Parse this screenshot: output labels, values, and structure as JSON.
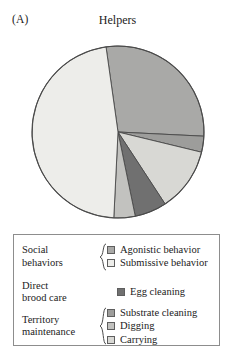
{
  "figure": {
    "panel_label": "(A)",
    "title": "Helpers"
  },
  "chart_data": {
    "type": "pie",
    "title": "Helpers",
    "xlabel": "",
    "ylabel": "",
    "legend_position": "bottom",
    "grid": false,
    "start_angle_deg": -98,
    "direction": "clockwise",
    "categories": [
      "Agonistic behavior",
      "Substrate cleaning",
      "Carrying",
      "Egg cleaning",
      "Digging",
      "Submissive behavior"
    ],
    "values": [
      28,
      3,
      12,
      6,
      4,
      47
    ],
    "unit": "percent of behavior",
    "colors": [
      "#a9a9a7",
      "#9d9d9b",
      "#d8d8d4",
      "#707070",
      "#c2c2bf",
      "#ededea"
    ],
    "slices": [
      {
        "label": "Agonistic behavior",
        "value": 28,
        "color": "#a9a9a7"
      },
      {
        "label": "Substrate cleaning",
        "value": 3,
        "color": "#9d9d9b"
      },
      {
        "label": "Carrying",
        "value": 12,
        "color": "#d8d8d4"
      },
      {
        "label": "Egg cleaning",
        "value": 6,
        "color": "#707070"
      },
      {
        "label": "Digging",
        "value": 4,
        "color": "#c2c2bf"
      },
      {
        "label": "Submissive behavior",
        "value": 47,
        "color": "#ededea"
      }
    ],
    "stroke_color": "#4a4a4a"
  },
  "legend": {
    "groups": [
      {
        "id": "social",
        "label_line1": "Social",
        "label_line2": "behaviors",
        "has_brace": true,
        "entries": [
          {
            "label": "Agonistic behavior",
            "color": "#a9a9a7"
          },
          {
            "label": "Submissive behavior",
            "color": "#ededea"
          }
        ]
      },
      {
        "id": "brood",
        "label_line1": "Direct",
        "label_line2": "brood care",
        "has_brace": false,
        "entries": [
          {
            "label": "Egg cleaning",
            "color": "#707070"
          }
        ]
      },
      {
        "id": "territory",
        "label_line1": "Territory",
        "label_line2": "maintenance",
        "has_brace": true,
        "entries": [
          {
            "label": "Substrate cleaning",
            "color": "#9d9d9b"
          },
          {
            "label": "Digging",
            "color": "#c2c2bf"
          },
          {
            "label": "Carrying",
            "color": "#d8d8d4"
          }
        ]
      }
    ]
  }
}
